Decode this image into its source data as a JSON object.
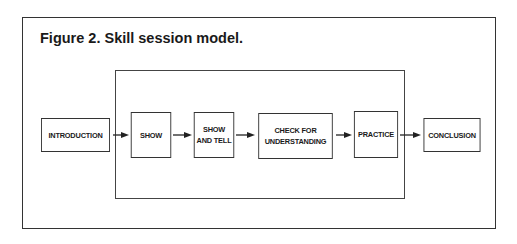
{
  "figure": {
    "title": "Figure 2. Skill session model."
  },
  "steps": [
    {
      "id": "introduction",
      "lines": [
        "INTRODUCTION"
      ]
    },
    {
      "id": "show",
      "lines": [
        "SHOW"
      ]
    },
    {
      "id": "show-and-tell",
      "lines": [
        "SHOW",
        "AND TELL"
      ]
    },
    {
      "id": "check-for-understanding",
      "lines": [
        "CHECK FOR",
        "UNDERSTANDING"
      ]
    },
    {
      "id": "practice",
      "lines": [
        "PRACTICE"
      ]
    },
    {
      "id": "conclusion",
      "lines": [
        "CONCLUSION"
      ]
    }
  ],
  "grouping": {
    "contains": [
      "show",
      "show-and-tell",
      "check-for-understanding",
      "practice"
    ]
  },
  "flow": [
    [
      "introduction",
      "show"
    ],
    [
      "show",
      "show-and-tell"
    ],
    [
      "show-and-tell",
      "check-for-understanding"
    ],
    [
      "check-for-understanding",
      "practice"
    ],
    [
      "practice",
      "conclusion"
    ]
  ]
}
